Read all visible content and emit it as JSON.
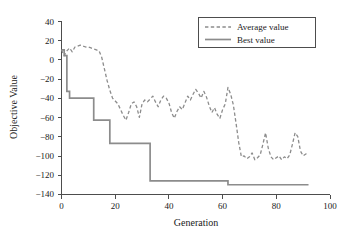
{
  "chart_data": {
    "type": "line",
    "title": "",
    "xlabel": "Generation",
    "ylabel": "Objective Value",
    "xlim": [
      0,
      100
    ],
    "ylim": [
      -140,
      40
    ],
    "xticks": [
      0,
      20,
      40,
      60,
      80,
      100
    ],
    "yticks": [
      40,
      20,
      0,
      -20,
      -40,
      -60,
      -80,
      -100,
      -120,
      -140
    ],
    "xtick_labels": [
      "0",
      "20",
      "40",
      "60",
      "80",
      "100"
    ],
    "ytick_labels": [
      "40",
      "20",
      "0",
      "−20",
      "−40",
      "−60",
      "−80",
      "−100",
      "−120",
      "−140"
    ],
    "grid": false,
    "legend_position": "top-right",
    "legend_entries": [
      "Average value",
      "Best value"
    ],
    "colors": {
      "average": "#8c8c8c",
      "best": "#8c8c8c",
      "axis": "#4d4d4d",
      "text": "#1a1a1a",
      "background": "#ffffff"
    },
    "series": [
      {
        "name": "Average value",
        "style": "dashed",
        "color": "#8c8c8c",
        "x": [
          0,
          1,
          2,
          3,
          4,
          5,
          6,
          7,
          8,
          9,
          10,
          11,
          12,
          13,
          14,
          15,
          16,
          17,
          18,
          19,
          20,
          21,
          22,
          23,
          24,
          25,
          26,
          27,
          28,
          29,
          30,
          31,
          32,
          33,
          34,
          35,
          36,
          37,
          38,
          39,
          40,
          41,
          42,
          43,
          44,
          45,
          46,
          47,
          48,
          49,
          50,
          51,
          52,
          53,
          54,
          55,
          56,
          57,
          58,
          59,
          60,
          61,
          62,
          63,
          64,
          65,
          66,
          67,
          68,
          69,
          70,
          71,
          72,
          73,
          74,
          75,
          76,
          77,
          78,
          79,
          80,
          81,
          82,
          83,
          84,
          85,
          86,
          87,
          88,
          89,
          90,
          91,
          92
        ],
        "values": [
          10,
          4,
          9,
          12,
          8,
          13,
          14,
          15,
          14,
          13,
          13,
          12,
          11,
          10,
          9,
          2,
          -10,
          -22,
          -32,
          -40,
          -43,
          -46,
          -52,
          -58,
          -63,
          -55,
          -46,
          -44,
          -49,
          -60,
          -46,
          -42,
          -44,
          -41,
          -38,
          -44,
          -49,
          -42,
          -38,
          -40,
          -45,
          -55,
          -61,
          -54,
          -49,
          -52,
          -45,
          -38,
          -42,
          -36,
          -31,
          -35,
          -40,
          -33,
          -39,
          -48,
          -55,
          -50,
          -57,
          -61,
          -52,
          -46,
          -29,
          -36,
          -47,
          -66,
          -86,
          -101,
          -100,
          -103,
          -101,
          -97,
          -104,
          -102,
          -99,
          -88,
          -76,
          -92,
          -101,
          -104,
          -102,
          -100,
          -104,
          -101,
          -103,
          -99,
          -88,
          -76,
          -80,
          -95,
          -100,
          -98,
          -99
        ]
      },
      {
        "name": "Best value",
        "style": "solid",
        "color": "#8c8c8c",
        "step": true,
        "x": [
          0,
          1,
          2,
          3,
          12,
          18,
          33,
          62,
          92
        ],
        "values": [
          10,
          4,
          -33,
          -40,
          -63,
          -87,
          -126,
          -130,
          -130
        ]
      }
    ]
  },
  "legend": {
    "average_label": "Average value",
    "best_label": "Best value"
  },
  "axes": {
    "x_title": "Generation",
    "y_title": "Objective Value"
  }
}
